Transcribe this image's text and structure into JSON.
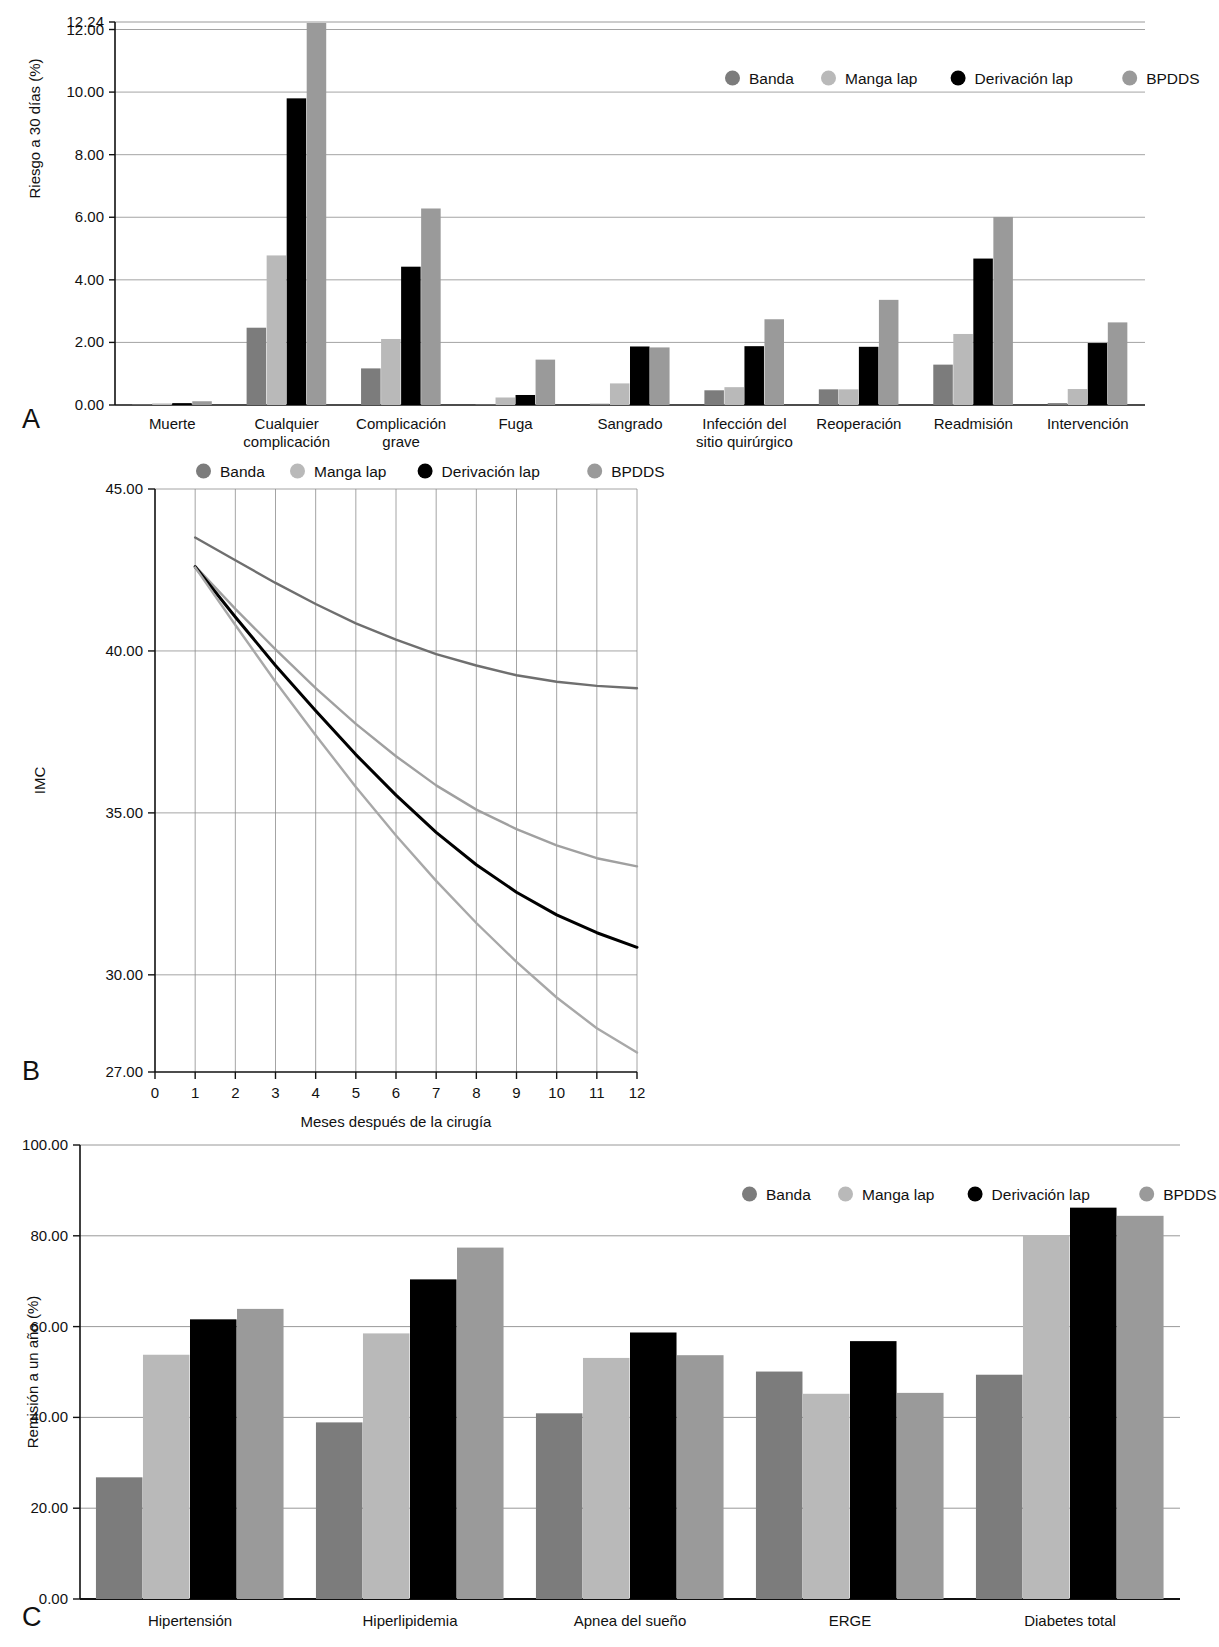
{
  "legend": {
    "items": [
      {
        "label": "Banda",
        "color": "#7c7c7c"
      },
      {
        "label": "Manga lap",
        "color": "#b9b9b9"
      },
      {
        "label": "Derivación lap",
        "color": "#000000"
      },
      {
        "label": "BPDDS",
        "color": "#9a9a9a"
      }
    ]
  },
  "panels": {
    "a": {
      "letter": "A"
    },
    "b": {
      "letter": "B"
    },
    "c": {
      "letter": "C"
    }
  },
  "chart_data": [
    {
      "id": "A",
      "type": "bar",
      "title": "",
      "xlabel": "",
      "ylabel": "Riesgo a 30 días (%)",
      "ylim": [
        0,
        12.24
      ],
      "yticks": [
        0,
        2,
        4,
        6,
        8,
        10,
        12,
        12.24
      ],
      "ytick_labels": [
        "0.00",
        "2.00",
        "4.00",
        "6.00",
        "8.00",
        "10.00",
        "12.00",
        "12.24"
      ],
      "grid": true,
      "legend_position": "top-right",
      "categories": [
        "Muerte",
        "Cualquier complicación",
        "Complicación grave",
        "Fuga",
        "Sangrado",
        "Infección del sitio quirúrgico",
        "Reoperación",
        "Readmisión",
        "Intervención"
      ],
      "category_lines": [
        [
          "Muerte"
        ],
        [
          "Cualquier",
          "complicación"
        ],
        [
          "Complicación",
          "grave"
        ],
        [
          "Fuga"
        ],
        [
          "Sangrado"
        ],
        [
          "Infección del",
          "sitio quirúrgico"
        ],
        [
          "Reoperación"
        ],
        [
          "Readmisión"
        ],
        [
          "Intervención"
        ]
      ],
      "series": [
        {
          "name": "Banda",
          "color": "#7c7c7c",
          "values": [
            0.02,
            2.47,
            1.17,
            0.0,
            0.04,
            0.47,
            0.5,
            1.29,
            0.06
          ]
        },
        {
          "name": "Manga lap",
          "color": "#b9b9b9",
          "values": [
            0.05,
            4.78,
            2.11,
            0.24,
            0.69,
            0.57,
            0.5,
            2.27,
            0.51
          ]
        },
        {
          "name": "Derivación lap",
          "color": "#000000",
          "values": [
            0.06,
            9.8,
            4.42,
            0.32,
            1.87,
            1.88,
            1.86,
            4.68,
            1.98
          ]
        },
        {
          "name": "BPDDS",
          "color": "#9a9a9a",
          "values": [
            0.12,
            12.21,
            6.28,
            1.45,
            1.84,
            2.74,
            3.36,
            6.01,
            2.64
          ]
        }
      ]
    },
    {
      "id": "B",
      "type": "line",
      "title": "",
      "xlabel": "Meses después de la cirugía",
      "ylabel": "IMC",
      "xlim": [
        0,
        12
      ],
      "ylim": [
        27.0,
        45.0
      ],
      "xticks": [
        0,
        1,
        2,
        3,
        4,
        5,
        6,
        7,
        8,
        9,
        10,
        11,
        12
      ],
      "xtick_labels": [
        "0",
        "1",
        "2",
        "3",
        "4",
        "5",
        "6",
        "7",
        "8",
        "9",
        "10",
        "11",
        "12"
      ],
      "yticks": [
        27,
        30,
        35,
        40,
        45
      ],
      "ytick_labels": [
        "27.00",
        "30.00",
        "35.00",
        "40.00",
        "45.00"
      ],
      "grid": true,
      "legend_position": "top-center",
      "x": [
        1,
        2,
        3,
        4,
        5,
        6,
        7,
        8,
        9,
        10,
        11,
        12
      ],
      "series": [
        {
          "name": "Banda",
          "color": "#6f6f6f",
          "values": [
            43.5,
            42.8,
            42.1,
            41.45,
            40.85,
            40.35,
            39.9,
            39.55,
            39.25,
            39.05,
            38.92,
            38.85
          ]
        },
        {
          "name": "Manga lap",
          "color": "#a0a0a0",
          "values": [
            42.62,
            41.3,
            40.05,
            38.85,
            37.75,
            36.75,
            35.85,
            35.1,
            34.5,
            34.0,
            33.6,
            33.35
          ]
        },
        {
          "name": "Derivación lap",
          "color": "#000000",
          "values": [
            42.6,
            41.05,
            39.55,
            38.15,
            36.8,
            35.55,
            34.4,
            33.4,
            32.55,
            31.85,
            31.3,
            30.85
          ]
        },
        {
          "name": "BPDDS",
          "color": "#a8a8a8",
          "values": [
            42.58,
            40.8,
            39.05,
            37.4,
            35.8,
            34.3,
            32.9,
            31.6,
            30.4,
            29.3,
            28.35,
            27.6
          ]
        }
      ]
    },
    {
      "id": "C",
      "type": "bar",
      "title": "",
      "xlabel": "",
      "ylabel": "Remisión a un año (%)",
      "ylim": [
        0,
        100
      ],
      "yticks": [
        0,
        20,
        40,
        60,
        80,
        100
      ],
      "ytick_labels": [
        "0.00",
        "20.00",
        "40.00",
        "60.00",
        "80.00",
        "100.00"
      ],
      "grid": true,
      "legend_position": "top-right",
      "categories": [
        "Hipertensión",
        "Hiperlipidemia",
        "Apnea del sueño",
        "ERGE",
        "Diabetes total"
      ],
      "series": [
        {
          "name": "Banda",
          "color": "#7c7c7c",
          "values": [
            26.8,
            38.9,
            40.9,
            50.1,
            49.4
          ]
        },
        {
          "name": "Manga lap",
          "color": "#b9b9b9",
          "values": [
            53.8,
            58.5,
            53.1,
            45.2,
            80.1
          ]
        },
        {
          "name": "Derivación lap",
          "color": "#000000",
          "values": [
            61.6,
            70.4,
            58.7,
            56.8,
            86.2
          ]
        },
        {
          "name": "BPDDS",
          "color": "#9a9a9a",
          "values": [
            63.9,
            77.4,
            53.7,
            45.4,
            84.4
          ]
        }
      ]
    }
  ]
}
